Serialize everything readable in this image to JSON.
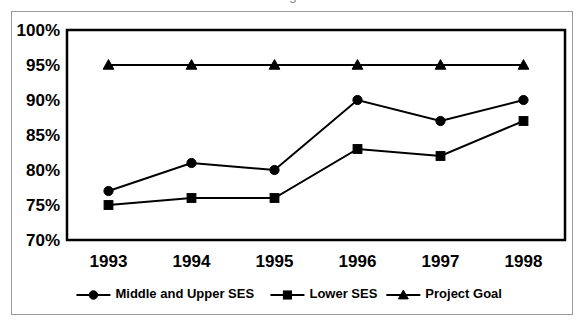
{
  "figure": {
    "cropped_title_fragment": "g",
    "frame_color": "#9a9a9a",
    "plot_border_color": "#000000",
    "background": "#ffffff"
  },
  "chart_data": {
    "type": "line",
    "title": "",
    "xlabel": "",
    "ylabel": "",
    "categories": [
      "1993",
      "1994",
      "1995",
      "1996",
      "1997",
      "1998"
    ],
    "x": [
      1993,
      1994,
      1995,
      1996,
      1997,
      1998
    ],
    "ylim": [
      70,
      100
    ],
    "ytick_step": 5,
    "ytick_labels": [
      "100%",
      "95%",
      "90%",
      "85%",
      "80%",
      "75%",
      "70%"
    ],
    "ytick_values": [
      100,
      95,
      90,
      85,
      80,
      75,
      70
    ],
    "grid": false,
    "legend_position": "bottom",
    "series": [
      {
        "name": "Middle and Upper SES",
        "marker": "circle",
        "color": "#000000",
        "values": [
          77,
          81,
          80,
          90,
          87,
          90
        ]
      },
      {
        "name": "Lower SES",
        "marker": "square",
        "color": "#000000",
        "values": [
          75,
          76,
          76,
          83,
          82,
          87
        ]
      },
      {
        "name": "Project Goal",
        "marker": "triangle",
        "color": "#000000",
        "values": [
          95,
          95,
          95,
          95,
          95,
          95
        ]
      }
    ]
  },
  "legend": {
    "items": [
      {
        "label": "Middle and Upper SES",
        "marker": "circle"
      },
      {
        "label": "Lower SES",
        "marker": "square"
      },
      {
        "label": "Project Goal",
        "marker": "triangle"
      }
    ]
  }
}
